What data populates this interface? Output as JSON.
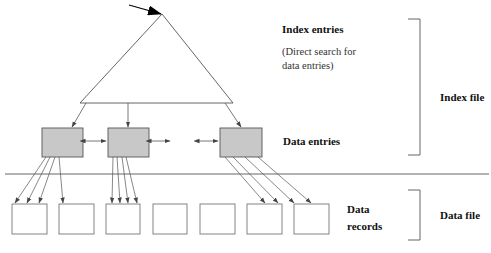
{
  "labels": {
    "index_entries": "Index entries",
    "index_note_line1": "(Direct search for",
    "index_note_line2": "data entries)",
    "data_entries": "Data entries",
    "data_records_line1": "Data",
    "data_records_line2": "records",
    "index_file": "Index file",
    "data_file": "Data file"
  },
  "colors": {
    "data_entry_fill": "#c8c8c8",
    "stroke": "#555555",
    "record_stroke": "#777777",
    "background": "#ffffff"
  },
  "structure": {
    "index_triangle": {
      "apex": [
        162,
        14
      ],
      "base_left": [
        80,
        103
      ],
      "base_right": [
        233,
        103
      ]
    },
    "entry_arrow": {
      "from": [
        130,
        5
      ],
      "to": [
        160,
        14
      ]
    },
    "data_entry_pages": [
      {
        "x": 42,
        "y": 128,
        "w": 41,
        "h": 29
      },
      {
        "x": 108,
        "y": 128,
        "w": 41,
        "h": 29
      },
      {
        "x": 220,
        "y": 128,
        "w": 42,
        "h": 29
      }
    ],
    "separator_y": 174,
    "data_records": [
      {
        "x": 12,
        "y": 204,
        "w": 35,
        "h": 30
      },
      {
        "x": 59,
        "y": 204,
        "w": 35,
        "h": 30
      },
      {
        "x": 106,
        "y": 204,
        "w": 34,
        "h": 30
      },
      {
        "x": 153,
        "y": 204,
        "w": 34,
        "h": 30
      },
      {
        "x": 200,
        "y": 204,
        "w": 35,
        "h": 30
      },
      {
        "x": 247,
        "y": 204,
        "w": 35,
        "h": 30
      },
      {
        "x": 294,
        "y": 204,
        "w": 35,
        "h": 30
      }
    ]
  }
}
